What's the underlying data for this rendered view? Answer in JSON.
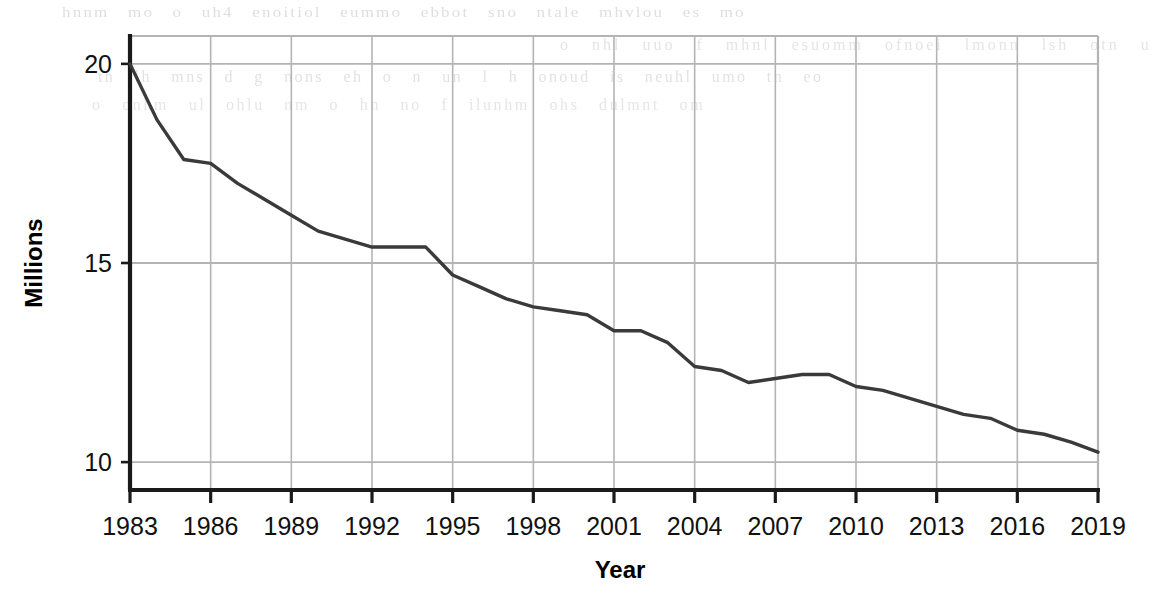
{
  "figure": {
    "kind": "line-chart",
    "background_color": "#ffffff",
    "line_color": "#3a3a3a",
    "grid_color": "#b4b4b4",
    "axis_color": "#1a1a1a"
  },
  "background_bleed": {
    "description": "faint show-through text from reverse of scanned page, illegible",
    "lines": [
      "hnnm  mo o uh4 enoitiol eummo  ebbot  sno   ntale mhvlou es  mo",
      "o  nhl   uuo f   mhnl esuomm   ofnoei  lmonn  lsh  otn  u",
      "tn  lh mns  d g nons  eh  o n un l h onoud  is  neuhl umo  tn  eo",
      "o   onhm  ul     ohlu nm  o   hn no  f ilunhm ohs  dulmnt  om"
    ]
  },
  "chart_data": {
    "type": "line",
    "title": "",
    "subtitle": "",
    "xlabel": "Year",
    "ylabel": "Millions",
    "xlim": [
      1983,
      2019
    ],
    "ylim": [
      9.3,
      20.7
    ],
    "grid": true,
    "legend": false,
    "legend_position": "none",
    "x_tick_labels": [
      "1983",
      "1986",
      "1989",
      "1992",
      "1995",
      "1998",
      "2001",
      "2004",
      "2007",
      "2010",
      "2013",
      "2016",
      "2019"
    ],
    "x_ticks": [
      1983,
      1986,
      1989,
      1992,
      1995,
      1998,
      2001,
      2004,
      2007,
      2010,
      2013,
      2016,
      2019
    ],
    "y_tick_labels": [
      "10",
      "15",
      "20"
    ],
    "y_ticks": [
      10,
      15,
      20
    ],
    "x": [
      1983,
      1984,
      1985,
      1986,
      1987,
      1988,
      1989,
      1990,
      1991,
      1992,
      1993,
      1994,
      1995,
      1996,
      1997,
      1998,
      1999,
      2000,
      2001,
      2002,
      2003,
      2004,
      2005,
      2006,
      2007,
      2008,
      2009,
      2010,
      2011,
      2012,
      2013,
      2014,
      2015,
      2016,
      2017,
      2018,
      2019
    ],
    "values": [
      20.0,
      18.6,
      17.6,
      17.5,
      17.0,
      16.6,
      16.2,
      15.8,
      15.6,
      15.4,
      15.4,
      15.4,
      14.7,
      14.4,
      14.1,
      13.9,
      13.8,
      13.7,
      13.3,
      13.3,
      13.0,
      12.4,
      12.3,
      12.0,
      12.1,
      12.2,
      12.2,
      11.9,
      11.8,
      11.6,
      11.4,
      11.2,
      11.1,
      10.8,
      10.7,
      10.5,
      10.25
    ],
    "series": [
      {
        "name": "Millions",
        "color": "#3a3a3a",
        "values": [
          20.0,
          18.6,
          17.6,
          17.5,
          17.0,
          16.6,
          16.2,
          15.8,
          15.6,
          15.4,
          15.4,
          15.4,
          14.7,
          14.4,
          14.1,
          13.9,
          13.8,
          13.7,
          13.3,
          13.3,
          13.0,
          12.4,
          12.3,
          12.0,
          12.1,
          12.2,
          12.2,
          11.9,
          11.8,
          11.6,
          11.4,
          11.2,
          11.1,
          10.8,
          10.7,
          10.5,
          10.25
        ]
      }
    ],
    "annotations": []
  },
  "plot_geometry": {
    "left": 130,
    "right": 1098,
    "top": 36,
    "bottom": 490
  }
}
